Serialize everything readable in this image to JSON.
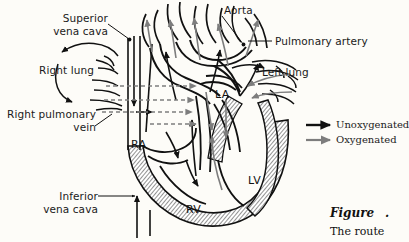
{
  "figure": {
    "background_color": "#fdfcf8",
    "ink_color": "#111111",
    "oxygenated_color": "#7d7d7d",
    "unoxygenated_color": "#111111",
    "wall_fill_color": "#9a9a9a"
  },
  "labels": {
    "superior_vena_cava": "Superior\nvena cava",
    "right_lung": "Right lung",
    "right_pulmonary_vein": "Right pulmonary\nvein",
    "inferior_vena_cava": "Inferior\nvena cava",
    "aorta": "Aorta",
    "pulmonary_artery": "Pulmonary artery",
    "left_lung": "Left lung"
  },
  "chambers": {
    "right_atrium": "RA",
    "right_ventricle": "RV",
    "left_atrium": "LA",
    "left_ventricle": "LV"
  },
  "legend": {
    "items": [
      {
        "label": "Unoxygenated",
        "icon": "arrow-right-icon",
        "color": "#111111"
      },
      {
        "label": "Oxygenated",
        "icon": "arrow-right-icon",
        "color": "#7d7d7d"
      }
    ]
  },
  "caption": {
    "figure_word": "Figure",
    "figure_number": ".",
    "body": "The route"
  }
}
